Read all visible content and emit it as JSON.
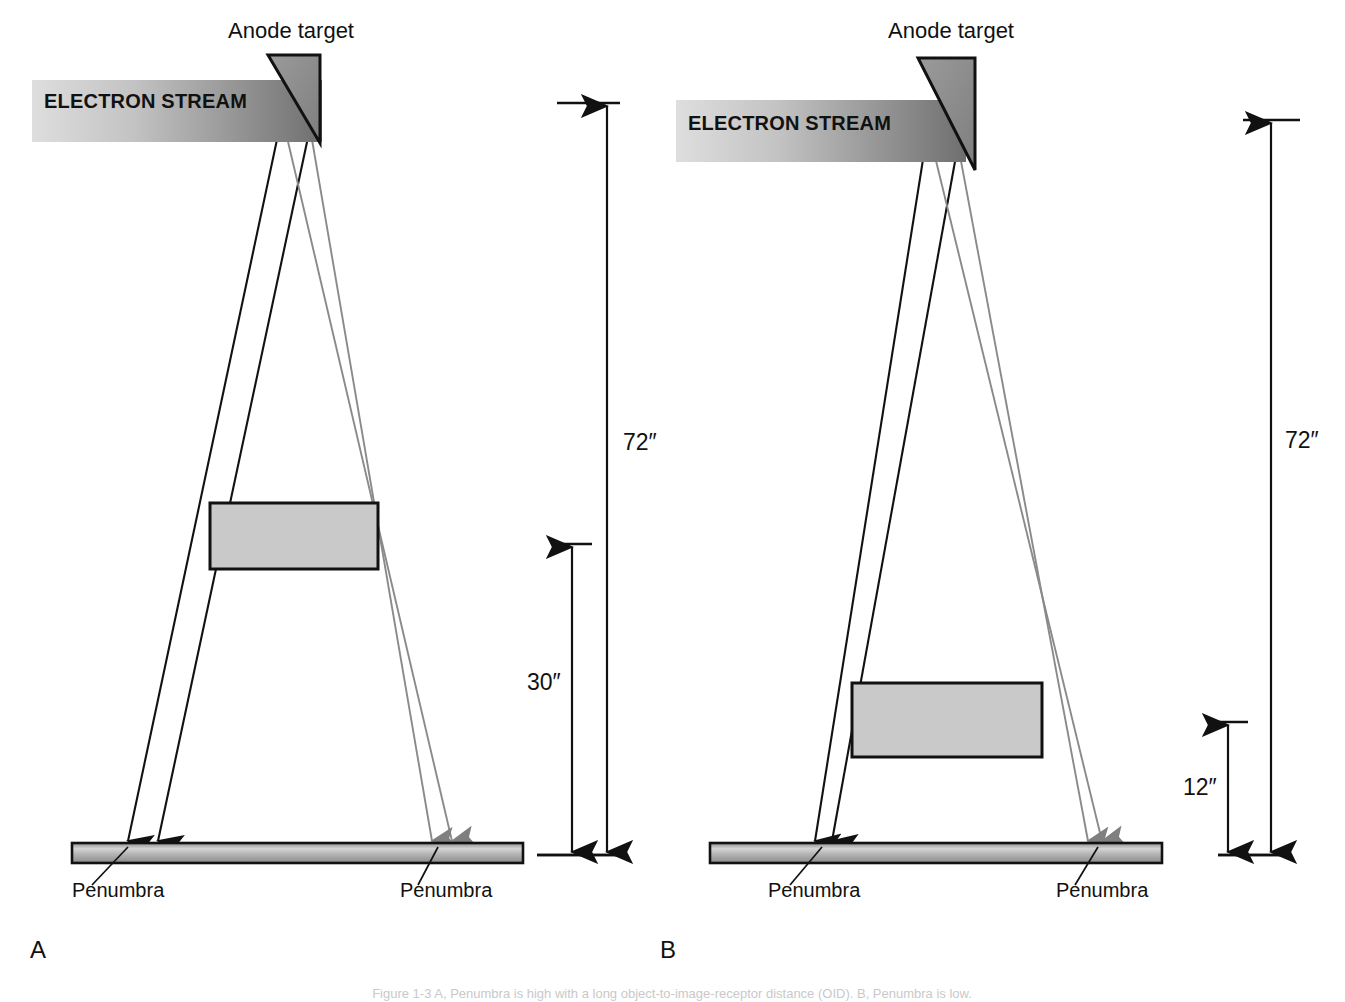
{
  "figure": {
    "width": 1345,
    "height": 1002,
    "background": "#ffffff",
    "caption_partial": "Figure  1-3    A, Penumbra is high with a long object-to-image-receptor distance (OID). B, Penumbra is low."
  },
  "colors": {
    "line": "#111111",
    "ray_black": "#111111",
    "ray_gray": "#8a8a8a",
    "anode_fill": "#8e8e8e",
    "object_fill": "#c9c9c9",
    "receptor_light": "#d6d6d6",
    "receptor_mid": "#a8a8a8",
    "receptor_dark": "#7d7d7d",
    "stream_light": "#d8d8d8",
    "stream_dark": "#6f6f6f",
    "caption_gray": "#c9c9c9"
  },
  "labels": {
    "anode_target": "Anode target",
    "electron_stream": "ELECTRON STREAM",
    "penumbra": "Penumbra"
  },
  "panels": [
    {
      "id": "A",
      "panel_label": "A",
      "panel_label_pos": {
        "x": 30,
        "y": 958
      },
      "anode_target_label_pos": {
        "x": 228,
        "y": 38
      },
      "electron_stream_label_pos": {
        "x": 44,
        "y": 108
      },
      "stream_band": {
        "x": 32,
        "y": 80,
        "w": 290,
        "h": 62
      },
      "anode": {
        "points": "268,55 320,55 320,143 268,55",
        "apex_x": 310,
        "apex_y": 142
      },
      "focal_points": [
        {
          "x": 282,
          "y": 116
        },
        {
          "x": 310,
          "y": 128
        }
      ],
      "object_box": {
        "x": 210,
        "y": 503,
        "w": 168,
        "h": 66
      },
      "receptor": {
        "x": 72,
        "y": 843,
        "w": 451,
        "h": 20
      },
      "rays": [
        {
          "from": 0,
          "to_x": 128,
          "color": "black",
          "arrow": true
        },
        {
          "from": 1,
          "to_x": 158,
          "color": "black",
          "arrow": true
        },
        {
          "from": 0,
          "to_x": 452,
          "color": "gray",
          "arrow": true
        },
        {
          "from": 1,
          "to_x": 432,
          "color": "gray",
          "arrow": true
        }
      ],
      "penumbra_marks": [
        {
          "bar_x": 128,
          "leader_to_x": 92,
          "label_x": 72,
          "label_y": 897
        },
        {
          "bar_x": 438,
          "leader_to_x": 418,
          "label_x": 400,
          "label_y": 897
        }
      ],
      "dimensions": [
        {
          "name": "sid",
          "value": "72″",
          "x": 607,
          "top_y": 103,
          "bottom_y": 855,
          "label_x": 623,
          "label_y": 450,
          "tick_top": {
            "x1": 557,
            "x2": 620
          },
          "tick_bottom": {
            "x1": 537,
            "x2": 627
          }
        },
        {
          "name": "oid",
          "value": "30″",
          "x": 572,
          "top_y": 544,
          "bottom_y": 855,
          "label_x": 527,
          "label_y": 690,
          "tick_top": {
            "x1": 552,
            "x2": 592
          },
          "tick_bottom": {
            "x1": 537,
            "x2": 627
          }
        }
      ]
    },
    {
      "id": "B",
      "panel_label": "B",
      "panel_label_pos": {
        "x": 660,
        "y": 958
      },
      "anode_target_label_pos": {
        "x": 888,
        "y": 38
      },
      "electron_stream_label_pos": {
        "x": 688,
        "y": 130
      },
      "stream_band": {
        "x": 676,
        "y": 100,
        "w": 290,
        "h": 62
      },
      "anode": {
        "points": "918,58 975,58 975,170 918,58",
        "apex_x": 963,
        "apex_y": 168
      },
      "focal_points": [
        {
          "x": 928,
          "y": 128
        },
        {
          "x": 958,
          "y": 145
        }
      ],
      "object_box": {
        "x": 852,
        "y": 683,
        "w": 190,
        "h": 74
      },
      "receptor": {
        "x": 710,
        "y": 843,
        "w": 452,
        "h": 20
      },
      "rays": [
        {
          "from": 0,
          "to_x": 815,
          "color": "black",
          "arrow": true
        },
        {
          "from": 1,
          "to_x": 832,
          "color": "black",
          "arrow": true
        },
        {
          "from": 0,
          "to_x": 1102,
          "color": "gray",
          "arrow": true
        },
        {
          "from": 1,
          "to_x": 1088,
          "color": "gray",
          "arrow": true
        }
      ],
      "penumbra_marks": [
        {
          "bar_x": 822,
          "leader_to_x": 790,
          "label_x": 768,
          "label_y": 897
        },
        {
          "bar_x": 1098,
          "leader_to_x": 1075,
          "label_x": 1056,
          "label_y": 897
        }
      ],
      "dimensions": [
        {
          "name": "sid",
          "value": "72″",
          "x": 1271,
          "top_y": 120,
          "bottom_y": 855,
          "label_x": 1285,
          "label_y": 448,
          "tick_top": {
            "x1": 1243,
            "x2": 1300
          },
          "tick_bottom": {
            "x1": 1218,
            "x2": 1288
          }
        },
        {
          "name": "oid",
          "value": "12″",
          "x": 1228,
          "top_y": 722,
          "bottom_y": 855,
          "label_x": 1183,
          "label_y": 795,
          "tick_top": {
            "x1": 1209,
            "x2": 1248
          },
          "tick_bottom": {
            "x1": 1218,
            "x2": 1288
          }
        }
      ]
    }
  ]
}
